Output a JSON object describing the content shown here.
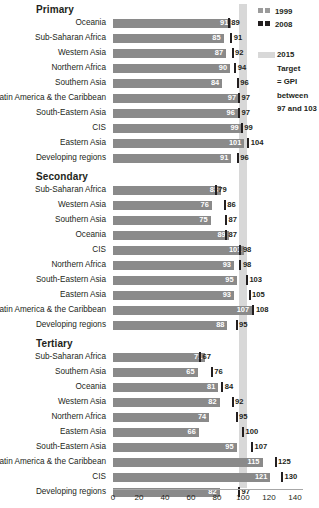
{
  "chart_data": {
    "type": "bar",
    "title": "",
    "xlabel": "",
    "ylabel": "",
    "xlim": [
      0,
      140
    ],
    "xticks": [
      0,
      20,
      40,
      60,
      80,
      100,
      120,
      140
    ],
    "grid": false,
    "orientation": "horizontal",
    "legend_position": "top-right",
    "series": [
      {
        "name": "1999",
        "color": "#8a8a8a",
        "style": "bar"
      },
      {
        "name": "2008",
        "color": "#231f20",
        "style": "marker"
      }
    ],
    "target_band": {
      "label": "2015 Target = GPI between 97 and 103",
      "from": 97,
      "to": 103,
      "color": "#d8d8d8"
    },
    "sections": [
      {
        "title": "Primary",
        "rows": [
          {
            "label": "Oceania",
            "v1999": 91,
            "v2008": 89
          },
          {
            "label": "Sub-Saharan Africa",
            "v1999": 85,
            "v2008": 91
          },
          {
            "label": "Western Asia",
            "v1999": 87,
            "v2008": 92
          },
          {
            "label": "Northern Africa",
            "v1999": 90,
            "v2008": 94
          },
          {
            "label": "Southern Asia",
            "v1999": 84,
            "v2008": 96
          },
          {
            "label": "Latin America & the Caribbean",
            "v1999": 97,
            "v2008": 97
          },
          {
            "label": "South-Eastern Asia",
            "v1999": 96,
            "v2008": 97
          },
          {
            "label": "CIS",
            "v1999": 99,
            "v2008": 99
          },
          {
            "label": "Eastern Asia",
            "v1999": 101,
            "v2008": 104
          },
          {
            "label": "Developing regions",
            "v1999": 91,
            "v2008": 96
          }
        ]
      },
      {
        "title": "Secondary",
        "rows": [
          {
            "label": "Sub-Saharan Africa",
            "v1999": 83,
            "v2008": 79
          },
          {
            "label": "Western Asia",
            "v1999": 76,
            "v2008": 86
          },
          {
            "label": "Southern Asia",
            "v1999": 75,
            "v2008": 87
          },
          {
            "label": "Oceania",
            "v1999": 89,
            "v2008": 87
          },
          {
            "label": "CIS",
            "v1999": 101,
            "v2008": 98
          },
          {
            "label": "Northern Africa",
            "v1999": 93,
            "v2008": 98
          },
          {
            "label": "South-Eastern Asia",
            "v1999": 95,
            "v2008": 103
          },
          {
            "label": "Eastern Asia",
            "v1999": 93,
            "v2008": 105
          },
          {
            "label": "Latin America & the Caribbean",
            "v1999": 107,
            "v2008": 108
          },
          {
            "label": "Developing regions",
            "v1999": 88,
            "v2008": 95
          }
        ]
      },
      {
        "title": "Tertiary",
        "rows": [
          {
            "label": "Sub-Saharan Africa",
            "v1999": 71,
            "v2008": 67
          },
          {
            "label": "Southern Asia",
            "v1999": 65,
            "v2008": 76
          },
          {
            "label": "Oceania",
            "v1999": 81,
            "v2008": 84
          },
          {
            "label": "Western Asia",
            "v1999": 82,
            "v2008": 92
          },
          {
            "label": "Northern Africa",
            "v1999": 74,
            "v2008": 95
          },
          {
            "label": "Eastern Asia",
            "v1999": 66,
            "v2008": 100
          },
          {
            "label": "South-Eastern Asia",
            "v1999": 95,
            "v2008": 107
          },
          {
            "label": "Latin America & the Caribbean",
            "v1999": 115,
            "v2008": 125
          },
          {
            "label": "CIS",
            "v1999": 121,
            "v2008": 130
          },
          {
            "label": "Developing regions",
            "v1999": 82,
            "v2008": 97
          }
        ]
      }
    ]
  },
  "legend": {
    "items": [
      {
        "label": "1999"
      },
      {
        "label": "2008"
      }
    ],
    "note_lines": [
      "2015",
      "Target",
      "= GPI",
      "between",
      "97 and 103"
    ]
  }
}
